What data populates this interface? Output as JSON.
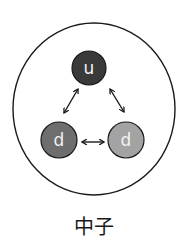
{
  "diagram": {
    "title": "中子",
    "particle": "neutron",
    "quarks": [
      {
        "id": "u",
        "label": "u",
        "color": "#3a3a3a"
      },
      {
        "id": "d1",
        "label": "d",
        "color": "#6e6e6e"
      },
      {
        "id": "d2",
        "label": "d",
        "color": "#a3a3a3"
      }
    ],
    "interactions": [
      {
        "from": "u",
        "to": "d1",
        "type": "double-arrow"
      },
      {
        "from": "u",
        "to": "d2",
        "type": "double-arrow"
      },
      {
        "from": "d1",
        "to": "d2",
        "type": "double-arrow"
      }
    ],
    "boundary_color": "#1a1a1a"
  }
}
